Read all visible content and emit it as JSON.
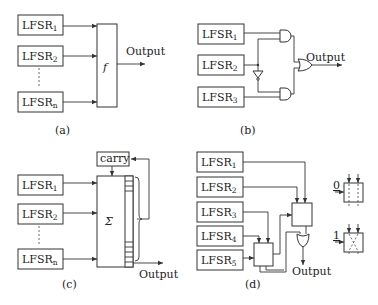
{
  "panels": {
    "a": {
      "caption": "(a)",
      "registers": [
        {
          "base": "LFSR",
          "sub": "1"
        },
        {
          "base": "LFSR",
          "sub": "2"
        },
        {
          "base": "LFSR",
          "sub": "n"
        }
      ],
      "function_label": "f",
      "output_label": "Output"
    },
    "b": {
      "caption": "(b)",
      "registers": [
        {
          "base": "LFSR",
          "sub": "1"
        },
        {
          "base": "LFSR",
          "sub": "2"
        },
        {
          "base": "LFSR",
          "sub": "3"
        }
      ],
      "output_label": "Output"
    },
    "c": {
      "caption": "(c)",
      "registers": [
        {
          "base": "LFSR",
          "sub": "1"
        },
        {
          "base": "LFSR",
          "sub": "2"
        },
        {
          "base": "LFSR",
          "sub": "n"
        }
      ],
      "carry_label": "carry",
      "sum_label": "Σ",
      "output_label": "Output"
    },
    "d": {
      "caption": "(d)",
      "registers": [
        {
          "base": "LFSR",
          "sub": "1"
        },
        {
          "base": "LFSR",
          "sub": "2"
        },
        {
          "base": "LFSR",
          "sub": "3"
        },
        {
          "base": "LFSR",
          "sub": "4"
        },
        {
          "base": "LFSR",
          "sub": "5"
        }
      ],
      "output_label": "Output",
      "switch_legend": [
        {
          "control": "0",
          "mode": "straight"
        },
        {
          "control": "1",
          "mode": "crossed"
        }
      ]
    }
  }
}
